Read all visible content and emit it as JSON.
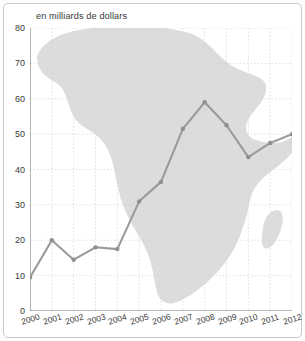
{
  "figure": {
    "title": "en milliards de dollars",
    "background_shape": "africa-map-silhouette",
    "colors": {
      "line": "#9a9a9a",
      "marker": "#8f8f8f",
      "map_fill": "#dcdcdc",
      "grid": "#d4d4d4",
      "axis": "#6d6d6d",
      "frame_border": "#c9c9c9",
      "text": "#3a3a3a",
      "background": "#ffffff"
    }
  },
  "chart_data": {
    "type": "line",
    "title": "en milliards de dollars",
    "xlabel": "",
    "ylabel": "",
    "categories": [
      "2000",
      "2001",
      "2002",
      "2003",
      "2004",
      "2005",
      "2006",
      "2007",
      "2008",
      "2009",
      "2010",
      "2011",
      "2012"
    ],
    "values": [
      9.5,
      20,
      14.5,
      18,
      17.5,
      31,
      36.5,
      51.5,
      59,
      52.5,
      43.5,
      47.5,
      50
    ],
    "series": [
      {
        "name": "en milliards de dollars",
        "values": [
          9.5,
          20,
          14.5,
          18,
          17.5,
          31,
          36.5,
          51.5,
          59,
          52.5,
          43.5,
          47.5,
          50
        ]
      }
    ],
    "ylim": [
      0,
      80
    ],
    "yticks": [
      0,
      10,
      20,
      30,
      40,
      50,
      60,
      70,
      80
    ],
    "ytick_labels": [
      "0",
      "10",
      "20",
      "30",
      "40",
      "50",
      "60",
      "70",
      "80"
    ],
    "xtick_labels": [
      "2000",
      "2001",
      "2002",
      "2003",
      "2004",
      "2005",
      "2006",
      "2007",
      "2008",
      "2009",
      "2010",
      "2011",
      "2012"
    ],
    "grid": true,
    "grid_style": "dotted",
    "legend": false,
    "markers": true,
    "xlabel_rotation": -17
  }
}
